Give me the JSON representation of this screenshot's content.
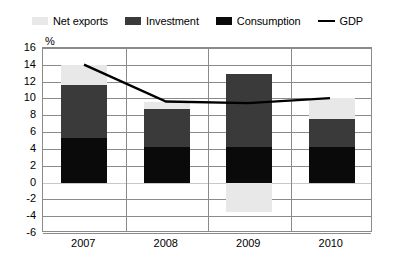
{
  "legend": {
    "items": [
      {
        "label": "Net exports",
        "color": "#e8e8e8",
        "type": "swatch",
        "icon": "square-swatch-icon"
      },
      {
        "label": "Investment",
        "color": "#3a3a3a",
        "type": "swatch",
        "icon": "square-swatch-icon"
      },
      {
        "label": "Consumption",
        "color": "#0a0a0a",
        "type": "swatch",
        "icon": "square-swatch-icon"
      },
      {
        "label": "GDP",
        "color": "#000000",
        "type": "line",
        "icon": "line-swatch-icon"
      }
    ]
  },
  "chart_data": {
    "type": "bar",
    "stacked": true,
    "title": "",
    "subtitle": "",
    "xlabel": "",
    "ylabel": "%",
    "categories": [
      "2007",
      "2008",
      "2009",
      "2010"
    ],
    "ylim": [
      -6,
      16
    ],
    "yticks": [
      16,
      14,
      12,
      10,
      8,
      6,
      4,
      2,
      0,
      -2,
      -4,
      -6
    ],
    "ytick_labels": [
      "16",
      "14",
      "12",
      "10",
      "8",
      "6",
      "4",
      "2",
      "0",
      "-2",
      "-4",
      "-6"
    ],
    "grid": true,
    "legend_position": "top",
    "series": [
      {
        "name": "Consumption",
        "type": "bar",
        "color": "#0a0a0a",
        "values": [
          5.3,
          4.2,
          4.2,
          4.2
        ]
      },
      {
        "name": "Investment",
        "type": "bar",
        "color": "#3a3a3a",
        "values": [
          6.3,
          4.6,
          8.7,
          3.4
        ]
      },
      {
        "name": "Net exports",
        "type": "bar",
        "color": "#e8e8e8",
        "values": [
          2.4,
          0.8,
          -3.5,
          2.4
        ]
      },
      {
        "name": "GDP",
        "type": "line",
        "color": "#000000",
        "values": [
          14.0,
          9.6,
          9.4,
          10.0
        ]
      }
    ],
    "axis_percent_symbol": "%"
  }
}
